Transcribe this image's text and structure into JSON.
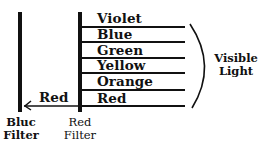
{
  "diagram": {
    "bands": [
      {
        "label": "Violet"
      },
      {
        "label": "Blue"
      },
      {
        "label": "Green"
      },
      {
        "label": "Yellow"
      },
      {
        "label": "Orange"
      },
      {
        "label": "Red"
      }
    ],
    "bracket_label_line1": "Visible",
    "bracket_label_line2": "Light",
    "transmitted_label": "Red",
    "blue_filter": {
      "line1": "Bluc",
      "line2": "Filter"
    },
    "red_filter": {
      "line1": "Red",
      "line2": "Filter"
    }
  }
}
